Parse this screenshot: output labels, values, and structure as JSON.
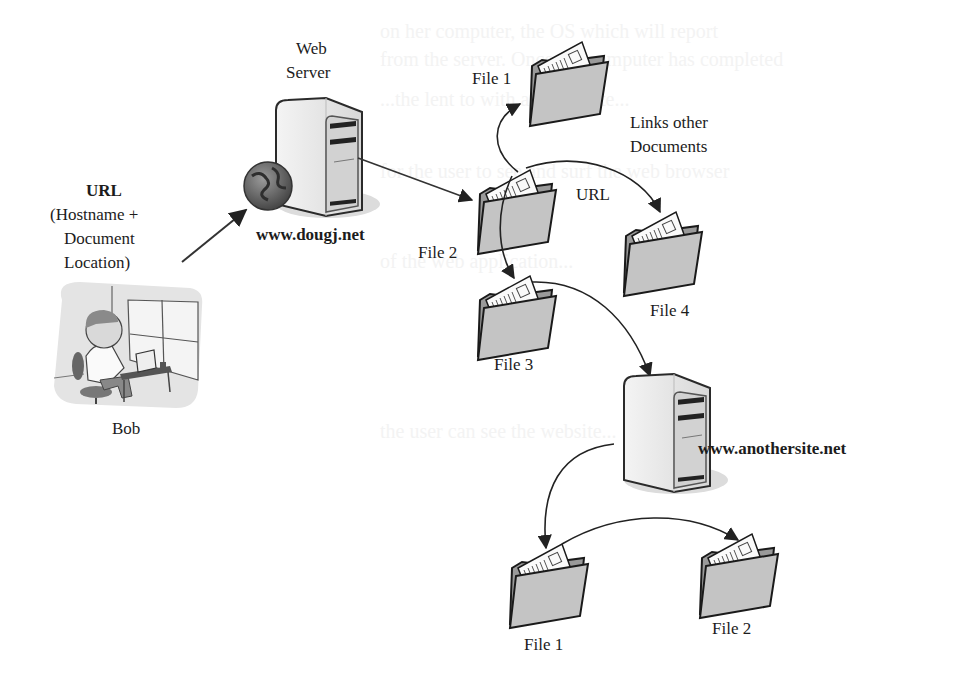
{
  "diagram": {
    "type": "web-documents-links",
    "nodes": {
      "web_server_label": [
        "Web",
        "Server"
      ],
      "web_server_host": "www.dougj.net",
      "url_request_label": [
        "URL",
        "(Hostname +",
        "Document",
        "Location)"
      ],
      "user_label": "Bob",
      "file1_top": "File 1",
      "file2_mid": "File 2",
      "file3_mid": "File 3",
      "file4_mid": "File 4",
      "links_label": [
        "Links other",
        "Documents"
      ],
      "url_label": "URL",
      "other_server_host": "www.anothersite.net",
      "file1_bottom": "File 1",
      "file2_bottom": "File 2"
    },
    "edges": [
      {
        "from": "Bob",
        "to": "www.dougj.net",
        "label": "URL (Hostname + Document Location)"
      },
      {
        "from": "www.dougj.net",
        "to": "File 2"
      },
      {
        "from": "File 2",
        "to": "File 1"
      },
      {
        "from": "File 2",
        "to": "File 4",
        "label": "URL"
      },
      {
        "from": "File 2",
        "to": "File 3"
      },
      {
        "from": "File 3",
        "to": "www.anothersite.net"
      },
      {
        "from": "www.anothersite.net",
        "to": "File 1 (anothersite)"
      },
      {
        "from": "File 1 (anothersite)",
        "to": "File 2 (anothersite)"
      }
    ],
    "colors": {
      "folder_fill": "#c4c4c4",
      "folder_stroke": "#1a1a1a",
      "server_fill": "#e6e6e6",
      "arrow": "#222222",
      "globe": "#5a5a5a"
    }
  }
}
